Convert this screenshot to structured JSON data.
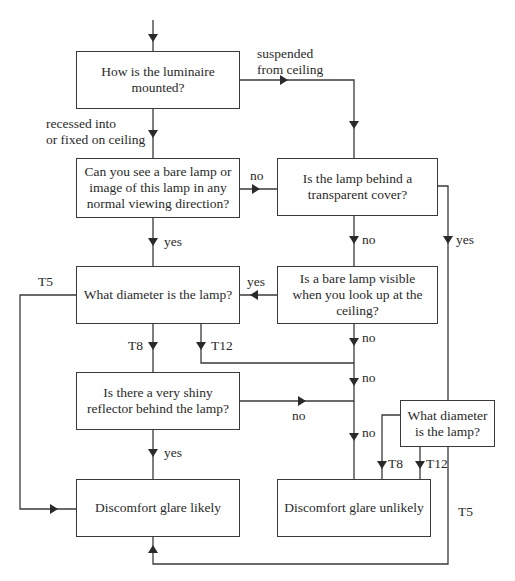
{
  "diagram": {
    "type": "flowchart",
    "nodes": [
      {
        "id": "mount",
        "text": "How is the luminaire mounted?"
      },
      {
        "id": "see_bare",
        "text": "Can you see a bare lamp or image of this lamp in any normal viewing direction?"
      },
      {
        "id": "transparent",
        "text": "Is the lamp behind a transparent cover?"
      },
      {
        "id": "diameter_left",
        "text": "What diameter is the lamp?"
      },
      {
        "id": "look_up",
        "text": "Is a bare lamp visible when you look up at the ceiling?"
      },
      {
        "id": "reflector",
        "text": "Is there a very shiny reflector behind the lamp?"
      },
      {
        "id": "diameter_right",
        "text": "What diameter is the lamp?"
      },
      {
        "id": "likely",
        "text": "Discomfort glare likely"
      },
      {
        "id": "unlikely",
        "text": "Discomfort glare unlikely"
      }
    ],
    "edge_labels": {
      "suspended": "suspended\nfrom ceiling",
      "recessed": "recessed into\nor fixed on ceiling",
      "see_bare_no": "no",
      "see_bare_yes": "yes",
      "transparent_no": "no",
      "transparent_yes": "yes",
      "look_up_yes": "yes",
      "look_up_no": "no",
      "diam_left_t5": "T5",
      "diam_left_t8": "T8",
      "diam_left_t12": "T12",
      "merge_no": "no",
      "reflector_no": "no",
      "reflector_yes": "yes",
      "unlikely_in_no": "no",
      "diam_right_t8": "T8",
      "diam_right_t12": "T12",
      "diam_right_t5": "T5"
    }
  }
}
